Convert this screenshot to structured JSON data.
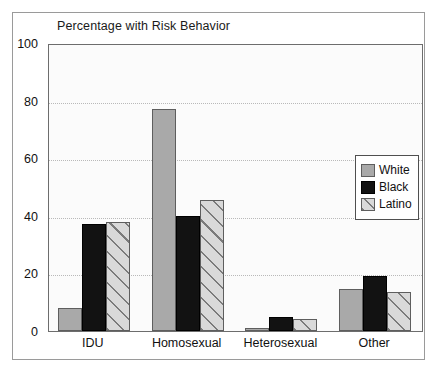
{
  "chart_data": {
    "type": "bar",
    "title": "Percentage with Risk Behavior",
    "xlabel": "",
    "ylabel": "",
    "ylim": [
      0,
      100
    ],
    "yticks": [
      0,
      20,
      40,
      60,
      80,
      100
    ],
    "grid": "horizontal-dotted",
    "legend_position": "right-middle",
    "categories": [
      "IDU",
      "Homosexual",
      "Heterosexual",
      "Other"
    ],
    "series": [
      {
        "name": "White",
        "style": "solid-gray",
        "color": "#a9a9a9",
        "values": [
          8,
          77,
          1,
          14.5
        ]
      },
      {
        "name": "Black",
        "style": "solid-black",
        "color": "#121212",
        "values": [
          37,
          40,
          5,
          19
        ]
      },
      {
        "name": "Latino",
        "style": "diagonal-hatch",
        "color": "#d9d9d9",
        "values": [
          38,
          45.5,
          4,
          13.5
        ]
      }
    ]
  },
  "legend": {
    "items": [
      {
        "label": "White",
        "swatch": "swatch-white"
      },
      {
        "label": "Black",
        "swatch": "swatch-black"
      },
      {
        "label": "Latino",
        "swatch": "swatch-latino-hatched"
      }
    ]
  },
  "axes": {
    "y_tick_labels": [
      "100",
      "80",
      "60",
      "40",
      "20",
      "0"
    ],
    "x_tick_labels": [
      "IDU",
      "Homosexual",
      "Heterosexual",
      "Other"
    ]
  }
}
